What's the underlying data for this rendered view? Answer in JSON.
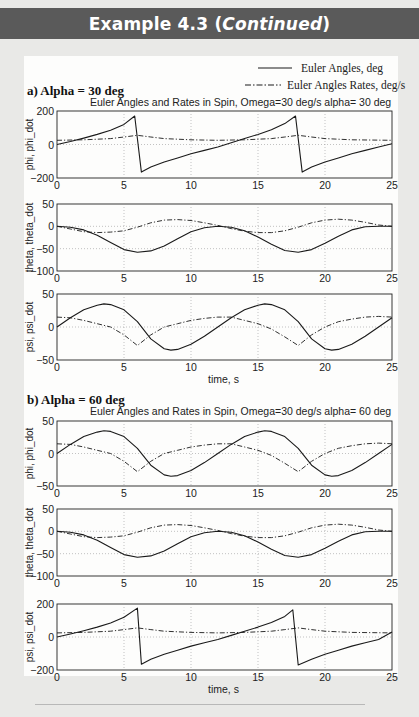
{
  "header": {
    "title_prefix": "Example 4.3 (",
    "title_italic": "Continued",
    "title_suffix": ")"
  },
  "legend": {
    "solid_label": "Euler Angles, deg",
    "dashdot_label": "Euler Angles Rates, deg/s"
  },
  "sections": [
    {
      "label": "a) Alpha = 30 deg",
      "title": "Euler Angles and Rates in Spin, Omega=30 deg/s  alpha= 30 deg"
    },
    {
      "label": "b) Alpha = 60 deg",
      "title": "Euler Angles and Rates in Spin, Omega=30 deg/s  alpha= 60 deg"
    }
  ],
  "xlabel": "time, s",
  "colors": {
    "header_bg": "#5a5a5a",
    "page_bg": "#e9e9e7",
    "panel_bg": "#fdfdfc",
    "line": "#1a1a1a",
    "grid": "#9a9a9a"
  },
  "chart_data": [
    {
      "type": "line",
      "section": "a) Alpha = 30 deg",
      "ylabel": "phi, phi_dot",
      "xlim": [
        0,
        25
      ],
      "ylim": [
        -200,
        200
      ],
      "yticks": [
        -200,
        0,
        200
      ],
      "xticks": [
        0,
        5,
        10,
        15,
        20,
        25
      ],
      "grid": true,
      "series": [
        {
          "name": "phi (deg)",
          "style": "solid",
          "x": [
            0,
            1,
            2,
            3,
            4,
            5,
            5.8,
            6.3,
            7,
            8,
            9,
            10,
            11,
            12,
            13,
            14,
            15,
            16,
            17,
            17.8,
            18.3,
            19,
            20,
            21,
            22,
            23,
            24,
            25
          ],
          "y": [
            0,
            18,
            38,
            60,
            85,
            120,
            170,
            -165,
            -135,
            -105,
            -80,
            -55,
            -35,
            -15,
            10,
            35,
            60,
            88,
            125,
            170,
            -165,
            -135,
            -105,
            -80,
            -55,
            -35,
            -15,
            5
          ]
        },
        {
          "name": "phi_dot (deg/s)",
          "style": "dashdot",
          "x": [
            0,
            2,
            4,
            5,
            6,
            7,
            8,
            10,
            12,
            14,
            16,
            17,
            18,
            19,
            20,
            22,
            25
          ],
          "y": [
            25,
            28,
            35,
            45,
            55,
            45,
            35,
            28,
            25,
            28,
            35,
            45,
            55,
            45,
            35,
            28,
            25
          ]
        }
      ]
    },
    {
      "type": "line",
      "section": "a) Alpha = 30 deg",
      "ylabel": "theta, theta_dot",
      "xlim": [
        0,
        25
      ],
      "ylim": [
        -100,
        50
      ],
      "yticks": [
        -100,
        -50,
        0,
        50
      ],
      "xticks": [
        0,
        5,
        10,
        15,
        20,
        25
      ],
      "grid": true,
      "series": [
        {
          "name": "theta (deg)",
          "style": "solid",
          "x": [
            0,
            1,
            2,
            3,
            4,
            5,
            6,
            7,
            8,
            9,
            10,
            11,
            12,
            13,
            14,
            15,
            16,
            17,
            18,
            19,
            20,
            21,
            22,
            23,
            24,
            25
          ],
          "y": [
            0,
            -2,
            -8,
            -20,
            -36,
            -52,
            -58,
            -55,
            -44,
            -28,
            -12,
            -3,
            0,
            -2,
            -10,
            -24,
            -40,
            -54,
            -58,
            -52,
            -38,
            -22,
            -8,
            -1,
            0,
            0
          ]
        },
        {
          "name": "theta_dot (deg/s)",
          "style": "dashdot",
          "x": [
            0,
            1,
            2,
            3,
            4,
            5,
            6,
            7,
            8,
            9,
            10,
            11,
            12,
            13,
            14,
            15,
            16,
            17,
            18,
            19,
            20,
            21,
            22,
            23,
            24,
            25
          ],
          "y": [
            0,
            -6,
            -12,
            -14,
            -13,
            -10,
            -2,
            8,
            14,
            15,
            13,
            8,
            2,
            -5,
            -11,
            -14,
            -14,
            -10,
            -2,
            8,
            14,
            16,
            14,
            9,
            3,
            0
          ]
        }
      ]
    },
    {
      "type": "line",
      "section": "a) Alpha = 30 deg",
      "ylabel": "psi, psi_dot",
      "xlabel": "time, s",
      "xlim": [
        0,
        25
      ],
      "ylim": [
        -50,
        50
      ],
      "yticks": [
        -50,
        0,
        50
      ],
      "xticks": [
        0,
        5,
        10,
        15,
        20,
        25
      ],
      "grid": true,
      "series": [
        {
          "name": "psi (deg)",
          "style": "solid",
          "x": [
            0,
            1,
            2,
            3,
            3.5,
            4,
            5,
            6,
            7,
            8,
            8.5,
            9,
            10,
            11,
            12,
            13,
            14,
            15,
            15.5,
            16,
            17,
            18,
            19,
            20,
            20.5,
            21,
            22,
            23,
            24,
            25
          ],
          "y": [
            0,
            14,
            26,
            33,
            35,
            34,
            26,
            8,
            -18,
            -33,
            -35,
            -34,
            -26,
            -14,
            0,
            14,
            26,
            33,
            35,
            34,
            26,
            8,
            -18,
            -33,
            -35,
            -34,
            -26,
            -14,
            0,
            14
          ]
        },
        {
          "name": "psi_dot (deg/s)",
          "style": "dashdot",
          "x": [
            0,
            1,
            2,
            3,
            4,
            5,
            6,
            7,
            8,
            9,
            10,
            11,
            12,
            13,
            14,
            15,
            16,
            17,
            18,
            19,
            20,
            21,
            22,
            23,
            24,
            25
          ],
          "y": [
            15,
            14,
            10,
            5,
            0,
            -12,
            -28,
            -12,
            0,
            5,
            10,
            13,
            15,
            15,
            10,
            5,
            -3,
            -15,
            -28,
            -12,
            0,
            8,
            12,
            15,
            16,
            15
          ]
        }
      ]
    },
    {
      "type": "line",
      "section": "b) Alpha = 60 deg",
      "ylabel": "phi, phi_dot",
      "xlim": [
        0,
        25
      ],
      "ylim": [
        -50,
        50
      ],
      "yticks": [
        -50,
        0,
        50
      ],
      "xticks": [
        0,
        5,
        10,
        15,
        20,
        25
      ],
      "grid": true,
      "series": [
        {
          "name": "phi (deg)",
          "style": "solid",
          "x": [
            0,
            1,
            2,
            3,
            3.5,
            4,
            5,
            6,
            7,
            8,
            8.5,
            9,
            10,
            11,
            12,
            13,
            14,
            15,
            15.5,
            16,
            17,
            18,
            19,
            20,
            20.5,
            21,
            22,
            23,
            24,
            25
          ],
          "y": [
            0,
            14,
            26,
            33,
            35,
            34,
            26,
            8,
            -18,
            -33,
            -35,
            -34,
            -26,
            -14,
            0,
            14,
            26,
            33,
            35,
            34,
            26,
            8,
            -18,
            -33,
            -35,
            -34,
            -26,
            -14,
            0,
            14
          ]
        },
        {
          "name": "phi_dot (deg/s)",
          "style": "dashdot",
          "x": [
            0,
            1,
            2,
            3,
            4,
            5,
            6,
            7,
            8,
            9,
            10,
            11,
            12,
            13,
            14,
            15,
            16,
            17,
            18,
            19,
            20,
            21,
            22,
            23,
            24,
            25
          ],
          "y": [
            15,
            14,
            10,
            5,
            0,
            -12,
            -28,
            -12,
            0,
            5,
            10,
            13,
            15,
            15,
            10,
            5,
            -3,
            -15,
            -28,
            -12,
            0,
            8,
            12,
            15,
            16,
            15
          ]
        }
      ]
    },
    {
      "type": "line",
      "section": "b) Alpha = 60 deg",
      "ylabel": "theta, theta_dot",
      "xlim": [
        0,
        25
      ],
      "ylim": [
        -100,
        50
      ],
      "yticks": [
        -100,
        -50,
        0,
        50
      ],
      "xticks": [
        0,
        5,
        10,
        15,
        20,
        25
      ],
      "grid": true,
      "series": [
        {
          "name": "theta (deg)",
          "style": "solid",
          "x": [
            0,
            1,
            2,
            3,
            4,
            5,
            6,
            7,
            8,
            9,
            10,
            11,
            12,
            13,
            14,
            15,
            16,
            17,
            18,
            19,
            20,
            21,
            22,
            23,
            24,
            25
          ],
          "y": [
            0,
            -2,
            -8,
            -20,
            -36,
            -52,
            -58,
            -55,
            -44,
            -28,
            -12,
            -3,
            0,
            -2,
            -10,
            -24,
            -40,
            -54,
            -58,
            -52,
            -38,
            -22,
            -8,
            -1,
            0,
            0
          ]
        },
        {
          "name": "theta_dot (deg/s)",
          "style": "dashdot",
          "x": [
            0,
            1,
            2,
            3,
            4,
            5,
            6,
            7,
            8,
            9,
            10,
            11,
            12,
            13,
            14,
            15,
            16,
            17,
            18,
            19,
            20,
            21,
            22,
            23,
            24,
            25
          ],
          "y": [
            0,
            -6,
            -12,
            -14,
            -13,
            -10,
            -2,
            8,
            14,
            15,
            13,
            8,
            2,
            -5,
            -11,
            -14,
            -14,
            -10,
            -2,
            8,
            14,
            16,
            14,
            9,
            3,
            0
          ]
        }
      ]
    },
    {
      "type": "line",
      "section": "b) Alpha = 60 deg",
      "ylabel": "psi, psi_dot",
      "xlabel": "time, s",
      "xlim": [
        0,
        25
      ],
      "ylim": [
        -200,
        200
      ],
      "yticks": [
        -200,
        0,
        200
      ],
      "xticks": [
        0,
        5,
        10,
        15,
        20,
        25
      ],
      "grid": true,
      "series": [
        {
          "name": "psi (deg)",
          "style": "solid",
          "x": [
            0,
            1,
            2,
            3,
            4,
            5,
            6,
            6.3,
            7,
            8,
            9,
            10,
            11,
            12,
            13,
            14,
            15,
            16,
            17,
            17.6,
            18,
            19,
            20,
            21,
            22,
            23,
            24,
            25
          ],
          "y": [
            0,
            18,
            38,
            60,
            85,
            120,
            175,
            -165,
            -135,
            -105,
            -80,
            -55,
            -35,
            -15,
            10,
            35,
            60,
            88,
            125,
            165,
            -170,
            -135,
            -105,
            -80,
            -55,
            -35,
            -15,
            30
          ]
        },
        {
          "name": "psi_dot (deg/s)",
          "style": "dashdot",
          "x": [
            0,
            2,
            4,
            5,
            6,
            7,
            8,
            10,
            12,
            14,
            16,
            17,
            18,
            19,
            20,
            22,
            25
          ],
          "y": [
            25,
            28,
            35,
            45,
            55,
            45,
            35,
            28,
            25,
            28,
            35,
            45,
            55,
            45,
            35,
            28,
            25
          ]
        }
      ]
    }
  ]
}
